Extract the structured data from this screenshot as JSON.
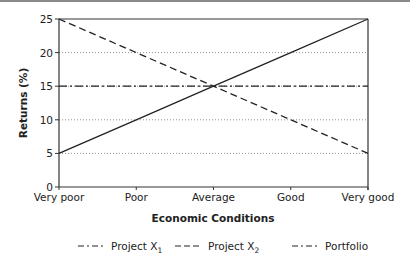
{
  "chart_data": {
    "type": "line",
    "title": "",
    "xlabel": "Economic Conditions",
    "ylabel": "Returns (%)",
    "categories": [
      "Very poor",
      "Poor",
      "Average",
      "Good",
      "Very good"
    ],
    "yticks": [
      0,
      5,
      10,
      15,
      20,
      25
    ],
    "ylim": [
      0,
      25
    ],
    "grid": "horizontal-dotted",
    "series": [
      {
        "name": "Project X",
        "subscript": "1",
        "style": "solid",
        "legend_style": "dash-dot",
        "values": [
          5,
          10,
          15,
          20,
          25
        ]
      },
      {
        "name": "Project X",
        "subscript": "2",
        "style": "dashed",
        "legend_style": "dashed",
        "values": [
          25,
          20,
          15,
          10,
          5
        ]
      },
      {
        "name": "Portfolio",
        "subscript": "",
        "style": "dash-dot",
        "legend_style": "dash-dot",
        "values": [
          15,
          15,
          15,
          15,
          15
        ]
      }
    ],
    "legend_position": "bottom"
  }
}
